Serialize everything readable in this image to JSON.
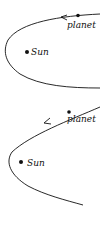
{
  "diagrams": [
    {
      "id": "top",
      "orbit_type": "closed",
      "labels": {
        "planet": "planet",
        "sun": "Sun"
      }
    },
    {
      "id": "bottom",
      "orbit_type": "open",
      "labels": {
        "planet": "planet",
        "sun": "Sun"
      }
    }
  ],
  "colors": {
    "stroke": "#111111",
    "background": "#ffffff"
  }
}
